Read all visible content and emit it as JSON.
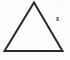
{
  "figure": {
    "kind": "geometry-diagram",
    "shape_name": "triangle",
    "background_color": "#fdfdfd",
    "stroke_color": "#2a2a2a",
    "stroke_width_px": 2,
    "canvas": {
      "width": 70,
      "height": 60
    },
    "vertices": {
      "apex": {
        "x": 34.0,
        "y": 2.5
      },
      "bottom_left": {
        "x": 4.5,
        "y": 51.0
      },
      "bottom_right": {
        "x": 62.5,
        "y": 51.0
      }
    },
    "polygon_points": "34.0,2.5 62.5,51.0 4.5,51.0",
    "labels": [
      {
        "id": "side-label-s",
        "text": "s",
        "describes": "right side length of the triangle",
        "color": "#232323",
        "font_size_px": 8,
        "position": {
          "x": 56,
          "y": 15
        }
      }
    ]
  }
}
